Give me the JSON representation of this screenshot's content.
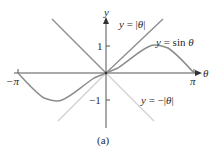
{
  "figure": {
    "caption": "(a)",
    "axes": {
      "x_label": "θ",
      "y_label": "y",
      "x_ticks": [
        {
          "label": "−π",
          "value": -3.14159
        },
        {
          "label": "π",
          "value": 3.14159
        }
      ],
      "y_ticks": [
        {
          "label": "1",
          "value": 1
        },
        {
          "label": "−1",
          "value": -1
        }
      ]
    },
    "curves": [
      {
        "name": "abs",
        "label": "y = |θ|",
        "color": "#8a8a8a"
      },
      {
        "name": "sin",
        "label": "y = sin θ",
        "color": "#8c8c8c"
      },
      {
        "name": "negabs",
        "label": "y = −|θ|",
        "color": "#cfcfcf"
      }
    ]
  },
  "labels": {
    "abs_y": "y",
    "abs_eq": " = |",
    "abs_theta": "θ",
    "abs_end": "|",
    "sin_y": "y",
    "sin_eq": " = sin ",
    "sin_theta": "θ",
    "neg_y": "y",
    "neg_eq": " = −|",
    "neg_theta": "θ",
    "neg_end": "|",
    "tick_one": "1",
    "tick_neg_one": "−1",
    "tick_neg_pi": "−π",
    "tick_pi": "π",
    "axis_y": "y",
    "axis_theta": "θ",
    "caption": "(a)"
  }
}
